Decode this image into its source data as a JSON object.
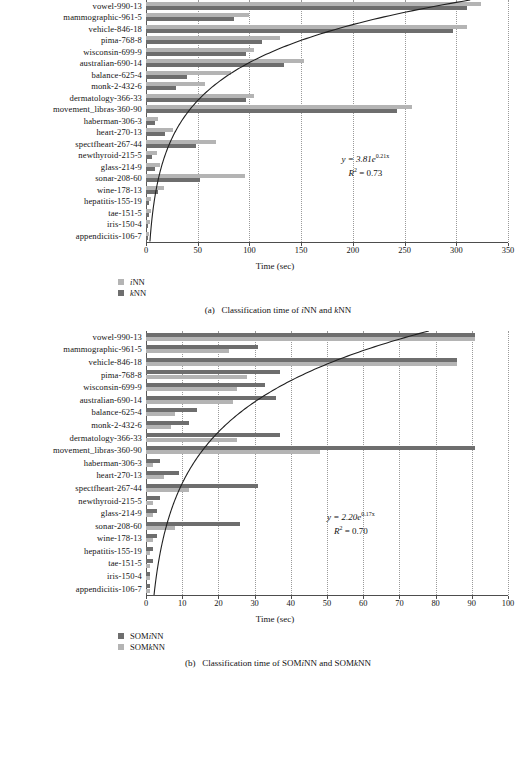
{
  "figure_a": {
    "caption_prefix": "(a)",
    "caption_text": "Classification time of iNN and kNN",
    "axis_title": "Time (sec)",
    "equation_line1": "y = 3.81e",
    "equation_exp": "0.21x",
    "equation_line2_lhs": "R",
    "equation_line2_sup": "2",
    "equation_line2_rhs": "= 0.73",
    "legend": [
      {
        "label": "iNN",
        "color": "#b4b4b4",
        "key": "light"
      },
      {
        "label": "kNN",
        "color": "#6e6e6e",
        "key": "dark"
      }
    ],
    "chart_data": {
      "type": "bar",
      "orientation": "horizontal",
      "title": "Classification time of iNN and kNN",
      "xlabel": "Time (sec)",
      "ylabel": "",
      "xlim": [
        0,
        350
      ],
      "xticks": [
        0,
        50,
        100,
        150,
        200,
        250,
        300,
        350
      ],
      "grid": true,
      "legend_position": "below-left",
      "categories": [
        "vowel-990-13",
        "mammographic-961-5",
        "vehicle-846-18",
        "pima-768-8",
        "wisconsin-699-9",
        "australian-690-14",
        "balance-625-4",
        "monk-2-432-6",
        "dermatology-366-33",
        "movement_libras-360-90",
        "haberman-306-3",
        "heart-270-13",
        "spectfheart-267-44",
        "newthyroid-215-5",
        "glass-214-9",
        "sonar-208-60",
        "wine-178-13",
        "hepatitis-155-19",
        "tae-151-5",
        "iris-150-4",
        "appendicitis-106-7"
      ],
      "series": [
        {
          "name": "iNN",
          "color": "#b4b4b4",
          "values": [
            324,
            100,
            310,
            130,
            104,
            153,
            82,
            57,
            104,
            257,
            12,
            26,
            68,
            11,
            14,
            96,
            17,
            5,
            5,
            4,
            3
          ]
        },
        {
          "name": "kNN",
          "color": "#6e6e6e",
          "values": [
            310,
            85,
            297,
            112,
            97,
            133,
            40,
            29,
            97,
            243,
            9,
            18,
            48,
            6,
            9,
            52,
            12,
            3,
            3,
            2,
            2
          ]
        }
      ],
      "trendline": {
        "kind": "exponential",
        "formula": "y = 3.81e^(0.21x)",
        "a": 3.81,
        "b": 0.21,
        "r2": 0.73
      }
    }
  },
  "figure_b": {
    "caption_prefix": "(b)",
    "caption_text": "Classification time of SOMiNN and SOMkNN",
    "axis_title": "Time (sec)",
    "equation_line1": "y = 2.20e",
    "equation_exp": "0.17x",
    "equation_line2_lhs": "R",
    "equation_line2_sup": "2",
    "equation_line2_rhs": "= 0.70",
    "legend": [
      {
        "label": "SOMiNN",
        "color": "#6e6e6e",
        "key": "dark"
      },
      {
        "label": "SOMkNN",
        "color": "#b4b4b4",
        "key": "light"
      }
    ],
    "chart_data": {
      "type": "bar",
      "orientation": "horizontal",
      "title": "Classification time of SOMiNN and SOMkNN",
      "xlabel": "Time (sec)",
      "ylabel": "",
      "xlim": [
        0,
        100
      ],
      "xticks": [
        0,
        10,
        20,
        30,
        40,
        50,
        60,
        70,
        80,
        90,
        100
      ],
      "grid": true,
      "legend_position": "below-left",
      "categories": [
        "vowel-990-13",
        "mammographic-961-5",
        "vehicle-846-18",
        "pima-768-8",
        "wisconsin-699-9",
        "australian-690-14",
        "balance-625-4",
        "monk-2-432-6",
        "dermatology-366-33",
        "movement_libras-360-90",
        "haberman-306-3",
        "heart-270-13",
        "spectfheart-267-44",
        "newthyroid-215-5",
        "glass-214-9",
        "sonar-208-60",
        "wine-178-13",
        "hepatitis-155-19",
        "tae-151-5",
        "iris-150-4",
        "appendicitis-106-7"
      ],
      "series": [
        {
          "name": "SOMiNN",
          "color": "#6e6e6e",
          "values": [
            91,
            31,
            86,
            37,
            33,
            36,
            14,
            12,
            37,
            91,
            4,
            9,
            31,
            4,
            3,
            26,
            3,
            2,
            2,
            1,
            1
          ]
        },
        {
          "name": "SOMkNN",
          "color": "#b4b4b4",
          "values": [
            91,
            23,
            86,
            28,
            25,
            24,
            8,
            7,
            25,
            48,
            2,
            5,
            12,
            2,
            2,
            8,
            2,
            1,
            1,
            1,
            1
          ]
        }
      ],
      "trendline": {
        "kind": "exponential",
        "formula": "y = 2.20e^(0.17x)",
        "a": 2.2,
        "b": 0.17,
        "r2": 0.7
      }
    }
  }
}
